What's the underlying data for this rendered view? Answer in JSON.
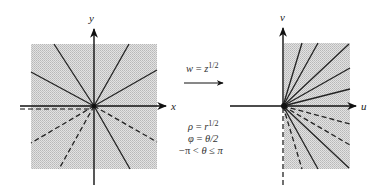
{
  "figure": {
    "left_plane": {
      "x_axis_label": "x",
      "y_axis_label": "y",
      "region": "full square (shaded)",
      "origin": [
        94,
        106
      ],
      "square": {
        "x": 31,
        "y": 44,
        "w": 126,
        "h": 125
      },
      "rays": [
        {
          "to": [
            54,
            44
          ],
          "style": "solid"
        },
        {
          "to": [
            129,
            44
          ],
          "style": "solid"
        },
        {
          "to": [
            31,
            72
          ],
          "style": "solid"
        },
        {
          "to": [
            157,
            70
          ],
          "style": "solid"
        },
        {
          "to": [
            31,
            143
          ],
          "style": "dashed"
        },
        {
          "to": [
            59,
            169
          ],
          "style": "dashed"
        },
        {
          "to": [
            130,
            169
          ],
          "style": "solid"
        },
        {
          "to": [
            157,
            142
          ],
          "style": "dashed"
        }
      ],
      "branch_cut": "dashed line along negative real axis"
    },
    "mapping": {
      "label_w": "w",
      "label_eq": " = ",
      "label_z": "z",
      "label_exp": "1/2",
      "eq_rho": {
        "lhs": "ρ",
        "rhs_base": "r",
        "rhs_exp": "1/2"
      },
      "eq_phi": {
        "lhs": "φ",
        "rhs": "θ/2"
      },
      "eq_range": {
        "left": "−π",
        "lt": "<",
        "theta": "θ",
        "le": "≤",
        "right": "π"
      }
    },
    "right_plane": {
      "u_axis_label": "u",
      "v_axis_label": "v",
      "region": "right half rectangle (shaded)",
      "origin": [
        283,
        106
      ],
      "rect": {
        "x": 284,
        "y": 43,
        "w": 66,
        "h": 126
      },
      "rays": [
        {
          "to": [
            302,
            43
          ],
          "style": "solid"
        },
        {
          "to": [
            318,
            43
          ],
          "style": "solid"
        },
        {
          "to": [
            349,
            44
          ],
          "style": "solid"
        },
        {
          "to": [
            350,
            68
          ],
          "style": "solid"
        },
        {
          "to": [
            350,
            89
          ],
          "style": "solid"
        },
        {
          "to": [
            350,
            124
          ],
          "style": "dashed"
        },
        {
          "to": [
            350,
            145
          ],
          "style": "dashed"
        },
        {
          "to": [
            349,
            168
          ],
          "style": "solid"
        },
        {
          "to": [
            318,
            169
          ],
          "style": "solid"
        },
        {
          "to": [
            302,
            169
          ],
          "style": "dashed"
        }
      ],
      "branch_image": "dashed line along negative imaginary axis"
    }
  }
}
